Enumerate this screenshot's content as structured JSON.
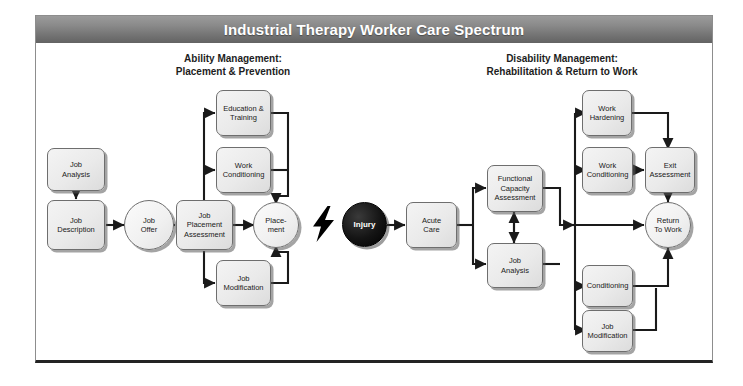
{
  "title": "Industrial Therapy Worker Care Spectrum",
  "headers": {
    "left_line1": "Ability Management:",
    "left_line2": "Placement & Prevention",
    "right_line1": "Disability Management:",
    "right_line2": "Rehabilitation & Return to Work"
  },
  "colors": {
    "title_band": "#7b7b7b",
    "node_fill": "#eaeaea",
    "node_border": "#6e6e6e",
    "injury_fill": "#000000",
    "text": "#1a1a1a",
    "connector": "#1a1a1a"
  },
  "nodes": {
    "job_analysis_left": "Job\nAnalysis",
    "job_description": "Job\nDescription",
    "job_offer": "Job\nOffer",
    "job_placement_assessment": "Job\nPlacement\nAssessment",
    "education_training": "Education &\nTraining",
    "work_conditioning_left": "Work\nConditioning",
    "job_modification_left": "Job\nModification",
    "placement": "Place-\nment",
    "injury": "Injury",
    "acute_care": "Acute\nCare",
    "functional_capacity_assessment": "Functional\nCapacity\nAssessment",
    "job_analysis_right": "Job\nAnalysis",
    "work_hardening": "Work\nHardening",
    "work_conditioning_right": "Work\nConditioning",
    "exit_assessment": "Exit\nAssessment",
    "return_to_work": "Return\nTo Work",
    "conditioning": "Conditioning",
    "job_modification_right": "Job\nModification"
  },
  "icons": {
    "lightning": "lightning-bolt-icon"
  },
  "flow": {
    "left_section_label": "Ability Management",
    "right_section_label": "Disability Management",
    "divider": "lightning bolt between Placement and Injury"
  }
}
